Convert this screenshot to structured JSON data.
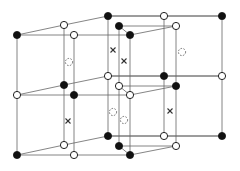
{
  "diagram": {
    "title": "",
    "legend": {
      "filled": "filled-atom",
      "open": "open-atom",
      "dashed": "dashed-site",
      "cross": "x-site"
    },
    "nodes": [
      {
        "x": 17,
        "y": 35,
        "type": "filled"
      },
      {
        "x": 17,
        "y": 95,
        "type": "open"
      },
      {
        "x": 17,
        "y": 155,
        "type": "filled"
      },
      {
        "x": 64,
        "y": 25,
        "type": "open"
      },
      {
        "x": 64,
        "y": 85,
        "type": "filled"
      },
      {
        "x": 64,
        "y": 145,
        "type": "open"
      },
      {
        "x": 74,
        "y": 35,
        "type": "open"
      },
      {
        "x": 74,
        "y": 95,
        "type": "filled"
      },
      {
        "x": 74,
        "y": 155,
        "type": "open"
      },
      {
        "x": 108,
        "y": 16,
        "type": "filled"
      },
      {
        "x": 108,
        "y": 76,
        "type": "open"
      },
      {
        "x": 108,
        "y": 136,
        "type": "filled"
      },
      {
        "x": 119,
        "y": 26,
        "type": "filled"
      },
      {
        "x": 119,
        "y": 86,
        "type": "open"
      },
      {
        "x": 119,
        "y": 146,
        "type": "filled"
      },
      {
        "x": 130,
        "y": 35,
        "type": "filled"
      },
      {
        "x": 130,
        "y": 95,
        "type": "open"
      },
      {
        "x": 130,
        "y": 155,
        "type": "filled"
      },
      {
        "x": 164,
        "y": 16,
        "type": "open"
      },
      {
        "x": 164,
        "y": 76,
        "type": "filled"
      },
      {
        "x": 164,
        "y": 136,
        "type": "open"
      },
      {
        "x": 176,
        "y": 26,
        "type": "open"
      },
      {
        "x": 176,
        "y": 86,
        "type": "filled"
      },
      {
        "x": 176,
        "y": 146,
        "type": "open"
      },
      {
        "x": 222,
        "y": 16,
        "type": "filled"
      },
      {
        "x": 222,
        "y": 76,
        "type": "open"
      },
      {
        "x": 222,
        "y": 136,
        "type": "filled"
      }
    ],
    "crosses": [
      {
        "x": 113,
        "y": 50
      },
      {
        "x": 124,
        "y": 61
      },
      {
        "x": 68,
        "y": 121
      },
      {
        "x": 170,
        "y": 111
      }
    ],
    "dashed_sites": [
      {
        "x": 69,
        "y": 62
      },
      {
        "x": 182,
        "y": 52
      },
      {
        "x": 113,
        "y": 112
      },
      {
        "x": 124,
        "y": 120
      }
    ]
  }
}
